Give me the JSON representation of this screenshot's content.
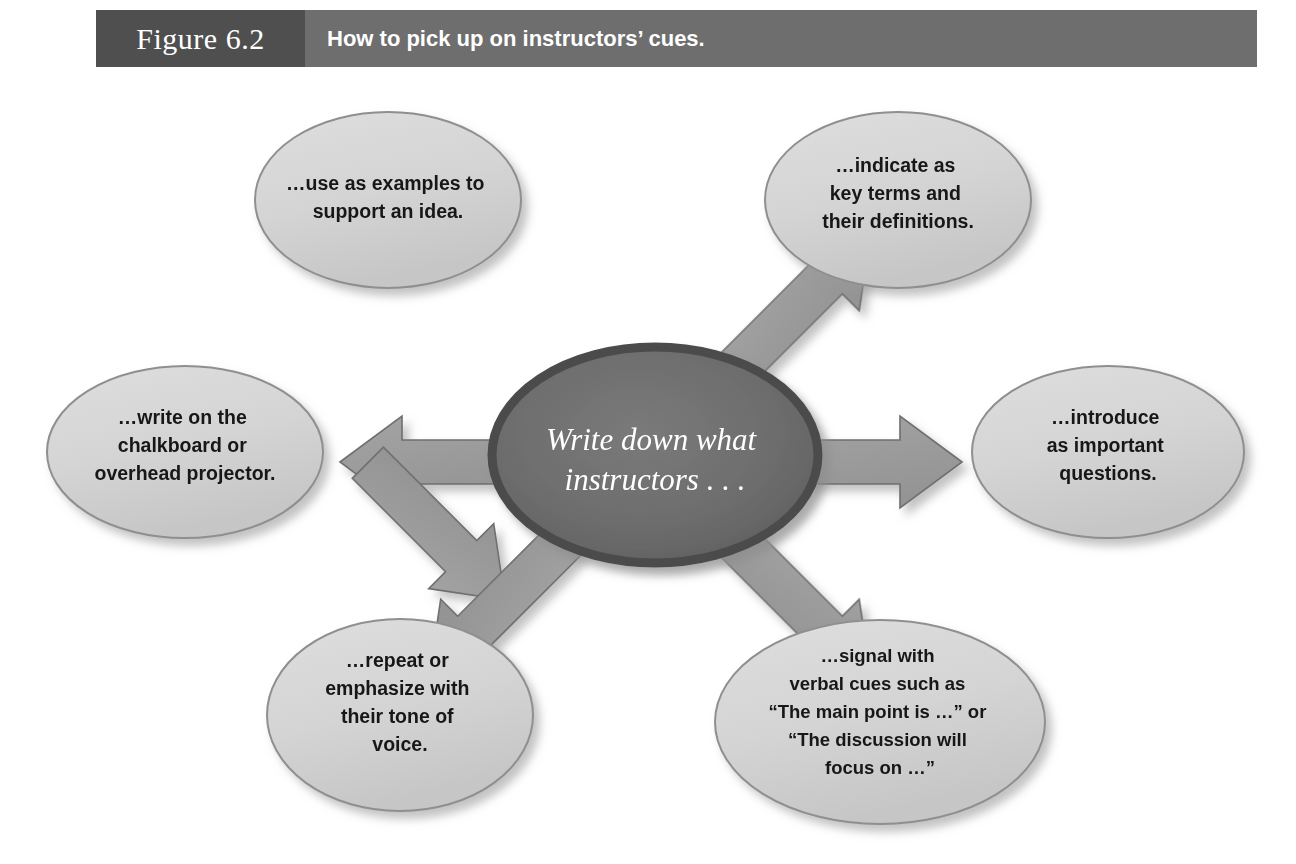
{
  "header": {
    "figure_label": "Figure 6.2",
    "title": "How to pick up on instructors’ cues.",
    "figure_bg": "#4f4f4f",
    "title_bg": "#6e6e6e",
    "text_color": "#ffffff"
  },
  "diagram": {
    "type": "hub-and-spoke",
    "hub": {
      "lines": [
        "Write down what",
        "instructors . . ."
      ],
      "fill": "#6b6b6b",
      "rim": "#4c4c4c",
      "text_color": "#ffffff"
    },
    "node_fill": "#d5d5d5",
    "node_stroke": "#8a8a8a",
    "arrow_fill": "#9a9a9a",
    "arrow_stroke": "#6f6f6f",
    "nodes": [
      {
        "id": "top-left",
        "direction": "up-left",
        "lines": [
          "…use as examples to",
          "support an idea."
        ]
      },
      {
        "id": "top-right",
        "direction": "up-right",
        "lines": [
          "…indicate as",
          "key terms and",
          "their definitions."
        ]
      },
      {
        "id": "left",
        "direction": "left",
        "lines": [
          "…write on the",
          "chalkboard or",
          "overhead projector."
        ]
      },
      {
        "id": "right",
        "direction": "right",
        "lines": [
          "…introduce",
          "as important",
          "questions."
        ]
      },
      {
        "id": "bottom-left",
        "direction": "down-left",
        "lines": [
          "…repeat or",
          "emphasize with",
          "their tone of",
          "voice."
        ]
      },
      {
        "id": "bottom-right",
        "direction": "down-right",
        "lines": [
          "…signal with",
          "verbal cues such as",
          "“The main point is …” or",
          "“The discussion will",
          "focus on …”"
        ]
      }
    ]
  }
}
